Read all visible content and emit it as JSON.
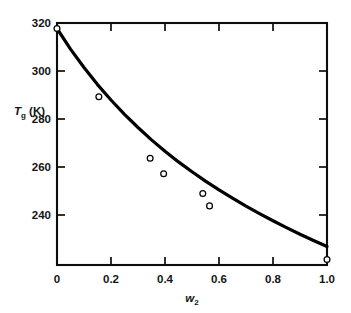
{
  "chart_data": {
    "type": "line",
    "title": "",
    "subtitle": "",
    "xlabel": "w2",
    "xlabel_base": "w",
    "xlabel_sub": "2",
    "ylabel": "Tg (K)",
    "ylabel_base": "T",
    "ylabel_sub": "g",
    "ylabel_unit": " (K)",
    "xlim": [
      0,
      1.0
    ],
    "ylim": [
      232,
      320
    ],
    "xticks": [
      0,
      0.2,
      0.4,
      0.6,
      0.8,
      1.0
    ],
    "xticklabels": [
      "0",
      "0.2",
      "0.4",
      "0.6",
      "0.8",
      "1.0"
    ],
    "yticks": [
      240,
      260,
      280,
      300,
      320
    ],
    "yticklabels": [
      "240",
      "260",
      "280",
      "300",
      "320"
    ],
    "grid": false,
    "legend": null,
    "series": [
      {
        "name": "fitted curve",
        "style": "solid-line",
        "color": "#000000",
        "x": [
          0.0,
          0.05,
          0.1,
          0.15,
          0.2,
          0.25,
          0.3,
          0.35,
          0.4,
          0.45,
          0.5,
          0.55,
          0.6,
          0.65,
          0.7,
          0.75,
          0.8,
          0.85,
          0.9,
          0.95,
          1.0
        ],
        "y": [
          318.0,
          310.5,
          303.8,
          297.6,
          292.0,
          286.8,
          282.0,
          277.5,
          273.4,
          269.5,
          265.9,
          262.5,
          259.3,
          256.3,
          253.4,
          250.7,
          248.1,
          245.6,
          243.2,
          240.9,
          238.7
        ]
      },
      {
        "name": "measured points",
        "style": "open-circle-markers",
        "color": "#000000",
        "x": [
          0.0,
          0.155,
          0.345,
          0.395,
          0.54,
          0.565,
          1.0
        ],
        "y": [
          318.0,
          293.2,
          270.8,
          265.2,
          258.0,
          253.5,
          234.0
        ]
      }
    ],
    "axis_colors": {
      "frame": "#0d0d0d",
      "curve": "#000000",
      "marker_fill": "#ffffff",
      "background": "#ffffff"
    }
  }
}
